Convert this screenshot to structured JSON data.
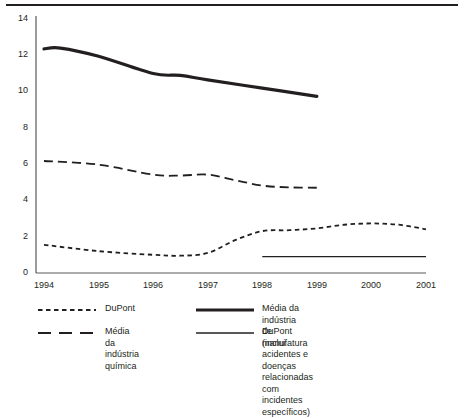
{
  "chart_data": {
    "type": "line",
    "title": "",
    "xlabel": "",
    "ylabel": "",
    "x": [
      1994,
      1995,
      1996,
      1997,
      1998,
      1999,
      2000,
      2001
    ],
    "xticklabels": [
      "1994",
      "1995",
      "1996",
      "1997",
      "1998",
      "1999",
      "2000",
      "2001"
    ],
    "yticklabels": [
      "0",
      "2",
      "4",
      "6",
      "8",
      "10",
      "12",
      "14"
    ],
    "yticks": [
      0,
      2,
      4,
      6,
      8,
      10,
      12,
      14
    ],
    "ylim": [
      0,
      14
    ],
    "xlim": [
      1994,
      2001
    ],
    "grid": false,
    "legend_position": "below",
    "series": [
      {
        "name": "DuPont",
        "style": "dotted",
        "color": "#231f20",
        "x": [
          1994,
          1995,
          1996,
          1996.5,
          1997,
          1997.5,
          1998,
          1998.5,
          1999,
          1999.5,
          2000,
          2000.5,
          2001
        ],
        "values": [
          1.55,
          1.2,
          1.0,
          0.95,
          1.1,
          1.8,
          2.3,
          2.35,
          2.45,
          2.65,
          2.72,
          2.65,
          2.4
        ]
      },
      {
        "name": "Média da indústria química",
        "style": "dashed",
        "color": "#231f20",
        "x": [
          1994,
          1995,
          1996,
          1996.5,
          1997,
          1997.5,
          1998,
          1998.5,
          1999
        ],
        "values": [
          6.15,
          5.95,
          5.4,
          5.35,
          5.4,
          5.1,
          4.8,
          4.7,
          4.68
        ]
      },
      {
        "name": "Média da indústria de manufatura",
        "style": "thick-solid",
        "color": "#231f20",
        "x": [
          1994,
          1994.3,
          1995,
          1996,
          1996.5,
          1997,
          1998,
          1999
        ],
        "values": [
          12.3,
          12.35,
          11.9,
          10.95,
          10.85,
          10.6,
          10.15,
          9.7
        ]
      },
      {
        "name": "DuPont (inclui acidentes e doenças relacionadas com incidentes específicos)",
        "style": "thin-solid",
        "color": "#231f20",
        "x": [
          1998,
          2001
        ],
        "values": [
          0.9,
          0.9
        ]
      }
    ]
  },
  "legend": {
    "items": [
      {
        "label": "DuPont",
        "style": "dotted"
      },
      {
        "label": "Média da indústria de manufatura",
        "style": "thick-solid"
      },
      {
        "label": "Média da indústria química",
        "style": "dashed"
      },
      {
        "label": "DuPont (inclui acidentes e doenças\nrelacionadas com incidentes específicos)",
        "style": "thin-solid"
      }
    ]
  }
}
